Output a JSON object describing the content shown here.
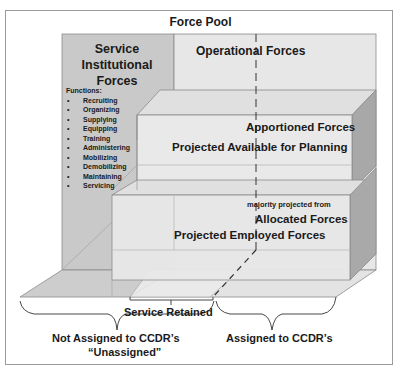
{
  "diagram": {
    "title": "Force Pool",
    "service_institutional_forces": {
      "label": "Service Institutional Forces",
      "line1": "Service",
      "line2": "Institutional",
      "line3": "Forces",
      "functions_header": "Functions:",
      "functions": [
        "Recruiting",
        "Organizing",
        "Supplying",
        "Equipping",
        "Training",
        "Administering",
        "Mobilizing",
        "Demobilizing",
        "Maintaining",
        "Servicing"
      ]
    },
    "operational_forces": "Operational Forces",
    "apportioned_box": {
      "label": "Apportioned Forces",
      "sublabel": "Projected Available for Planning"
    },
    "allocated_box": {
      "note": "majority projected from",
      "label": "Allocated Forces",
      "sublabel": "Projected Employed Forces"
    },
    "braces": {
      "service_retained": "Service Retained",
      "not_assigned_line1": "Not Assigned to CCDR’s",
      "not_assigned_line2": "“Unassigned”",
      "assigned": "Assigned to CCDR’s"
    },
    "colors": {
      "back_panel_left": "#c8c8c8",
      "back_panel_right": "#e6e6e6",
      "box_front": "#e8e8e8",
      "box_top": "#e2e2e2",
      "box_side": "#a9a9a9",
      "floor_left": "#cfcfcf",
      "floor_right": "#e4e4e4",
      "border": "#9a9a9a",
      "text": "#1a1a1a"
    }
  }
}
